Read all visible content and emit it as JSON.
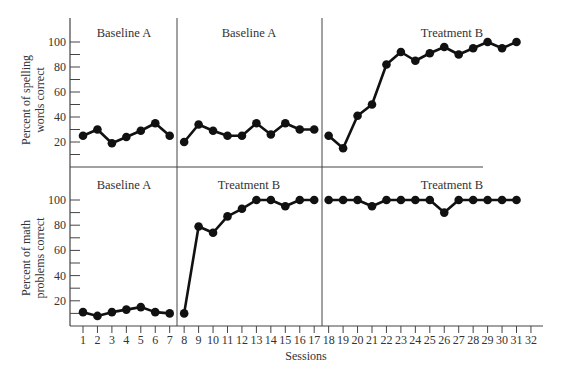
{
  "chart_data": [
    {
      "type": "line",
      "title": "",
      "ylabel": "Percent of spelling words correct",
      "ylabel_lines": [
        "Percent of spelling",
        "words correct"
      ],
      "xlabel": "",
      "ylim": [
        0,
        110
      ],
      "yticks": [
        20,
        40,
        60,
        80,
        100
      ],
      "phases": [
        {
          "label": "Baseline A",
          "sessions": [
            1,
            7
          ]
        },
        {
          "label": "Baseline A",
          "sessions": [
            8,
            17
          ]
        },
        {
          "label": "Treatment B",
          "sessions": [
            18,
            31
          ]
        }
      ],
      "series": [
        {
          "name": "Baseline A (1-7)",
          "x": [
            1,
            2,
            3,
            4,
            5,
            6,
            7
          ],
          "values": [
            25,
            30,
            19,
            24,
            29,
            35,
            25
          ]
        },
        {
          "name": "Baseline A (8-17)",
          "x": [
            8,
            9,
            10,
            11,
            12,
            13,
            14,
            15,
            16,
            17
          ],
          "values": [
            20,
            34,
            29,
            25,
            25,
            35,
            26,
            35,
            30,
            30
          ]
        },
        {
          "name": "Treatment B (18-31)",
          "x": [
            18,
            19,
            20,
            21,
            22,
            23,
            24,
            25,
            26,
            27,
            28,
            29,
            30,
            31
          ],
          "values": [
            25,
            15,
            41,
            50,
            82,
            92,
            85,
            91,
            96,
            90,
            95,
            100,
            95,
            100
          ]
        }
      ]
    },
    {
      "type": "line",
      "title": "",
      "ylabel": "Percent of math problems correct",
      "ylabel_lines": [
        "Percent of math",
        "problems correct"
      ],
      "xlabel": "Sessions",
      "ylim": [
        0,
        110
      ],
      "yticks": [
        20,
        40,
        60,
        80,
        100
      ],
      "x_ticks": [
        1,
        2,
        3,
        4,
        5,
        6,
        7,
        8,
        9,
        10,
        11,
        12,
        13,
        14,
        15,
        16,
        17,
        18,
        19,
        20,
        21,
        22,
        23,
        24,
        25,
        26,
        27,
        28,
        29,
        30,
        31,
        32
      ],
      "phases": [
        {
          "label": "Baseline A",
          "sessions": [
            1,
            7
          ]
        },
        {
          "label": "Treatment B",
          "sessions": [
            8,
            17
          ]
        },
        {
          "label": "Treatment B",
          "sessions": [
            18,
            31
          ]
        }
      ],
      "series": [
        {
          "name": "Baseline A (1-7)",
          "x": [
            1,
            2,
            3,
            4,
            5,
            6,
            7
          ],
          "values": [
            11,
            8,
            11,
            13,
            15,
            11,
            10
          ]
        },
        {
          "name": "Treatment B (8-17)",
          "x": [
            8,
            9,
            10,
            11,
            12,
            13,
            14,
            15,
            16,
            17
          ],
          "values": [
            10,
            79,
            74,
            87,
            93,
            100,
            100,
            95,
            100,
            100
          ]
        },
        {
          "name": "Treatment B (18-31)",
          "x": [
            18,
            19,
            20,
            21,
            22,
            23,
            24,
            25,
            26,
            27,
            28,
            29,
            30,
            31
          ],
          "values": [
            100,
            100,
            100,
            95,
            100,
            100,
            100,
            100,
            90,
            100,
            100,
            100,
            100,
            100
          ]
        }
      ]
    }
  ],
  "labels": {
    "top_ylabel_1": "Percent of spelling",
    "top_ylabel_2": "words correct",
    "bottom_ylabel_1": "Percent of math",
    "bottom_ylabel_2": "problems correct",
    "xlabel": "Sessions",
    "top_phase_1": "Baseline A",
    "top_phase_2": "Baseline A",
    "top_phase_3": "Treatment B",
    "bottom_phase_1": "Baseline A",
    "bottom_phase_2": "Treatment B",
    "bottom_phase_3": "Treatment B"
  },
  "colors": {
    "line": "#111111",
    "axis": "#444444",
    "text": "#333333"
  }
}
